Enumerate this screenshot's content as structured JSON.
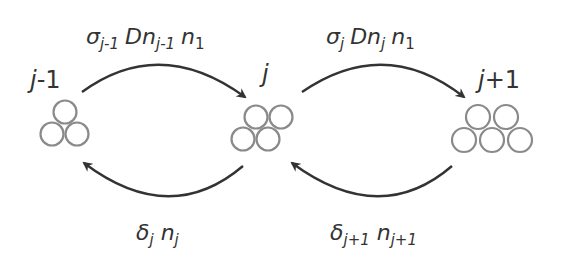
{
  "diagram": {
    "colors": {
      "circle_stroke": "#8a8a8a",
      "arrow": "#333333",
      "text": "#333333",
      "background": "#ffffff"
    },
    "nodes": [
      {
        "id": "j-1",
        "label_main": "j",
        "label_suffix": "-1",
        "circle_count": 3
      },
      {
        "id": "j",
        "label_main": "j",
        "label_suffix": "",
        "circle_count": 4
      },
      {
        "id": "j+1",
        "label_main": "j",
        "label_suffix": "+1",
        "circle_count": 5
      }
    ],
    "edges": [
      {
        "from": "j-1",
        "to": "j",
        "direction": "forward",
        "rate": {
          "sigma": "σ",
          "sigma_sub": "j-1",
          "D": "Dn",
          "D_sub": "j-1",
          "n": "n",
          "n_sub": "1"
        }
      },
      {
        "from": "j",
        "to": "j+1",
        "direction": "forward",
        "rate": {
          "sigma": "σ",
          "sigma_sub": "j",
          "D": "Dn",
          "D_sub": "j",
          "n": "n",
          "n_sub": "1"
        }
      },
      {
        "from": "j",
        "to": "j-1",
        "direction": "backward",
        "rate": {
          "delta": "δ",
          "delta_sub": "j",
          "n": "n",
          "n_sub": "j"
        }
      },
      {
        "from": "j+1",
        "to": "j",
        "direction": "backward",
        "rate": {
          "delta": "δ",
          "delta_sub": "j+1",
          "n": "n",
          "n_sub": "j+1"
        }
      }
    ]
  }
}
